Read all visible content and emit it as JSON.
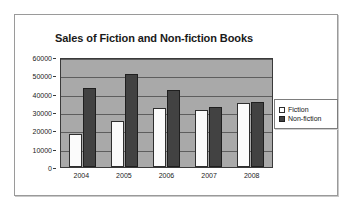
{
  "chart_data": {
    "type": "bar",
    "title": "Sales of Fiction and Non-fiction Books",
    "xlabel": "",
    "ylabel": "",
    "categories": [
      "2004",
      "2005",
      "2006",
      "2007",
      "2008"
    ],
    "series": [
      {
        "name": "Fiction",
        "values": [
          18000,
          25000,
          32000,
          31000,
          35000
        ],
        "color": "#ffffff"
      },
      {
        "name": "Non-fiction",
        "values": [
          43000,
          51000,
          42000,
          33000,
          35500
        ],
        "color": "#424242"
      }
    ],
    "ylim": [
      0,
      60000
    ],
    "yticks": [
      0,
      10000,
      20000,
      30000,
      40000,
      50000,
      60000
    ],
    "ytick_labels": [
      "0",
      "10000",
      "20000",
      "30000",
      "40000",
      "50000",
      "60000"
    ],
    "grid": true,
    "legend_position": "right",
    "plot_background": "#a9a9a9"
  }
}
